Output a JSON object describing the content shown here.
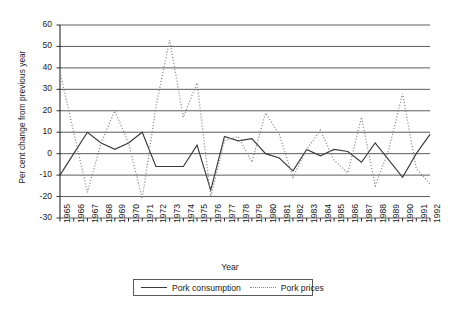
{
  "chart_data": {
    "type": "line",
    "title": "",
    "xlabel": "Year",
    "ylabel": "Per cent change from previous year",
    "ylim": [
      -30,
      60
    ],
    "ytick_step": 10,
    "yticks": [
      60,
      50,
      40,
      30,
      20,
      10,
      0,
      -10,
      -20,
      -30
    ],
    "grid": true,
    "grid_axis": "y",
    "legend_position": "bottom",
    "categories": [
      1965,
      1966,
      1967,
      1968,
      1969,
      1970,
      1971,
      1972,
      1973,
      1974,
      1975,
      1976,
      1977,
      1978,
      1979,
      1980,
      1981,
      1982,
      1983,
      1984,
      1985,
      1986,
      1987,
      1988,
      1989,
      1990,
      1991,
      1992
    ],
    "xtick_labels": [
      "1965",
      "1966",
      "1967",
      "1968",
      "1969",
      "1970",
      "1971",
      "1972",
      "1973",
      "1974",
      "1975",
      "1976",
      "1977",
      "1978",
      "1979",
      "1980",
      "1981",
      "1982",
      "1983",
      "1984",
      "1985",
      "1986",
      "1987",
      "1988",
      "1989",
      "1990",
      "1991",
      "1992"
    ],
    "series": [
      {
        "name": "Pork consumption",
        "style": "solid",
        "color": "#3a3a3a",
        "values": [
          -10,
          0,
          10,
          5,
          2,
          5,
          10,
          -6,
          -6,
          -6,
          4,
          -17,
          8,
          6,
          7,
          0,
          -2,
          -8,
          2,
          -1,
          2,
          1,
          -4,
          5,
          -3,
          -11,
          0,
          9
        ]
      },
      {
        "name": "Pork prices",
        "style": "dotted",
        "color": "#8a8a8a",
        "values": [
          38,
          10,
          -18,
          5,
          20,
          5,
          -21,
          22,
          53,
          17,
          33,
          -20,
          6,
          8,
          -4,
          19,
          9,
          -11,
          2,
          11,
          -3,
          -9,
          17,
          -15,
          2,
          28,
          -7,
          -14
        ]
      }
    ]
  },
  "legend": {
    "items": [
      {
        "label": "Pork consumption",
        "style": "solid"
      },
      {
        "label": "Pork prices",
        "style": "dotted"
      }
    ]
  },
  "axes": {
    "x_title": "Year",
    "y_title": "Per cent change from previous year"
  }
}
